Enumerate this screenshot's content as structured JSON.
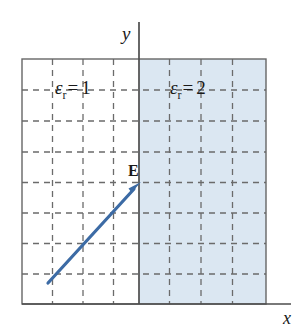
{
  "figure": {
    "background_color": "#ffffff",
    "axes": {
      "y_label": "y",
      "x_label": "x",
      "axis_color": "#4d4d4d",
      "y_axis_x": 139,
      "y_axis_top": 22,
      "y_axis_bottom": 304,
      "x_axis_y": 304,
      "x_axis_left": 22,
      "x_axis_right": 291
    },
    "box": {
      "left": 22,
      "top": 59,
      "right": 266,
      "bottom": 304,
      "border_color": "#666666",
      "border_width": 1.4
    },
    "grid": {
      "columns": 8,
      "rows": 8,
      "style": "dashed",
      "color": "#6b6b6b",
      "dash": "6,5",
      "width": 1.3
    },
    "regions": [
      {
        "name": "left-region",
        "label": "ε",
        "subscript": "r",
        "equals": "=",
        "value": "1",
        "fill_color": "#ffffff",
        "x_from": 22,
        "x_to": 139
      },
      {
        "name": "right-region",
        "label": "ε",
        "subscript": "r",
        "equals": "=",
        "value": "2",
        "fill_color": "#dbe7f2",
        "x_from": 139,
        "x_to": 266
      }
    ],
    "vector": {
      "name": "E",
      "label": "E",
      "color": "#3c6ba5",
      "line_width": 3.2,
      "start_x": 48,
      "start_y": 283,
      "end_x": 141,
      "end_y": 182,
      "arrowhead_length": 17,
      "arrowhead_halfwidth": 6
    }
  }
}
